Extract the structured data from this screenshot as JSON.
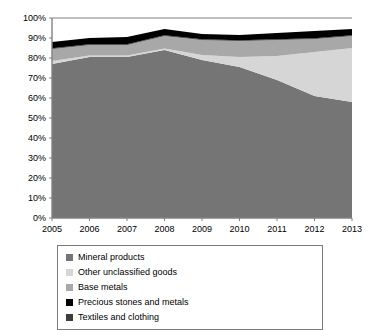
{
  "chart_data": {
    "type": "area",
    "stacked": true,
    "percent_stacked": true,
    "title": "",
    "subtitle": "",
    "xlabel": "",
    "ylabel": "",
    "grid": false,
    "legend_position": "bottom",
    "x": [
      2005,
      2006,
      2007,
      2008,
      2009,
      2010,
      2011,
      2012,
      2013
    ],
    "categories": [
      "2005",
      "2006",
      "2007",
      "2008",
      "2009",
      "2010",
      "2011",
      "2012",
      "2013"
    ],
    "xlim": [
      2005,
      2013
    ],
    "ylim": [
      0,
      100
    ],
    "ytick_labels": [
      "0%",
      "10%",
      "20%",
      "30%",
      "40%",
      "50%",
      "60%",
      "70%",
      "80%",
      "90%",
      "100%"
    ],
    "ytick_values": [
      0,
      10,
      20,
      30,
      40,
      50,
      60,
      70,
      80,
      90,
      100
    ],
    "series": [
      {
        "name": "Mineral products",
        "color": "#757575",
        "values": [
          77.0,
          80.5,
          80.5,
          84.0,
          79.0,
          75.5,
          69.0,
          61.0,
          58.0
        ]
      },
      {
        "name": "Other unclassified goods",
        "color": "#d6d6d6",
        "values": [
          1.5,
          0.8,
          0.8,
          0.8,
          2.5,
          5.0,
          12.0,
          22.0,
          27.0
        ]
      },
      {
        "name": "Base metals",
        "color": "#a8a8a8",
        "values": [
          6.0,
          5.2,
          5.2,
          6.2,
          7.5,
          8.0,
          8.0,
          6.5,
          6.0
        ]
      },
      {
        "name": "Textiles and clothing",
        "color": "#3d3d3d",
        "values": [
          0.4,
          0.4,
          0.4,
          0.4,
          0.4,
          0.4,
          0.4,
          0.4,
          0.4
        ]
      },
      {
        "name": "Precious stones and metals",
        "color": "#000000",
        "values": [
          3.1,
          3.1,
          3.6,
          3.1,
          2.6,
          2.6,
          3.1,
          3.6,
          3.1
        ]
      }
    ]
  },
  "legend": {
    "items": [
      {
        "label": "Mineral products",
        "color": "#757575",
        "column": "left"
      },
      {
        "label": "Other unclassified goods",
        "color": "#d6d6d6",
        "column": "right"
      },
      {
        "label": "Base metals",
        "color": "#a8a8a8",
        "column": "left"
      },
      {
        "label": "Precious stones and metals",
        "color": "#000000",
        "column": "right"
      },
      {
        "label": "Textiles and clothing",
        "color": "#3d3d3d",
        "column": "left"
      }
    ]
  },
  "axes": {
    "axis_color": "#808080"
  }
}
